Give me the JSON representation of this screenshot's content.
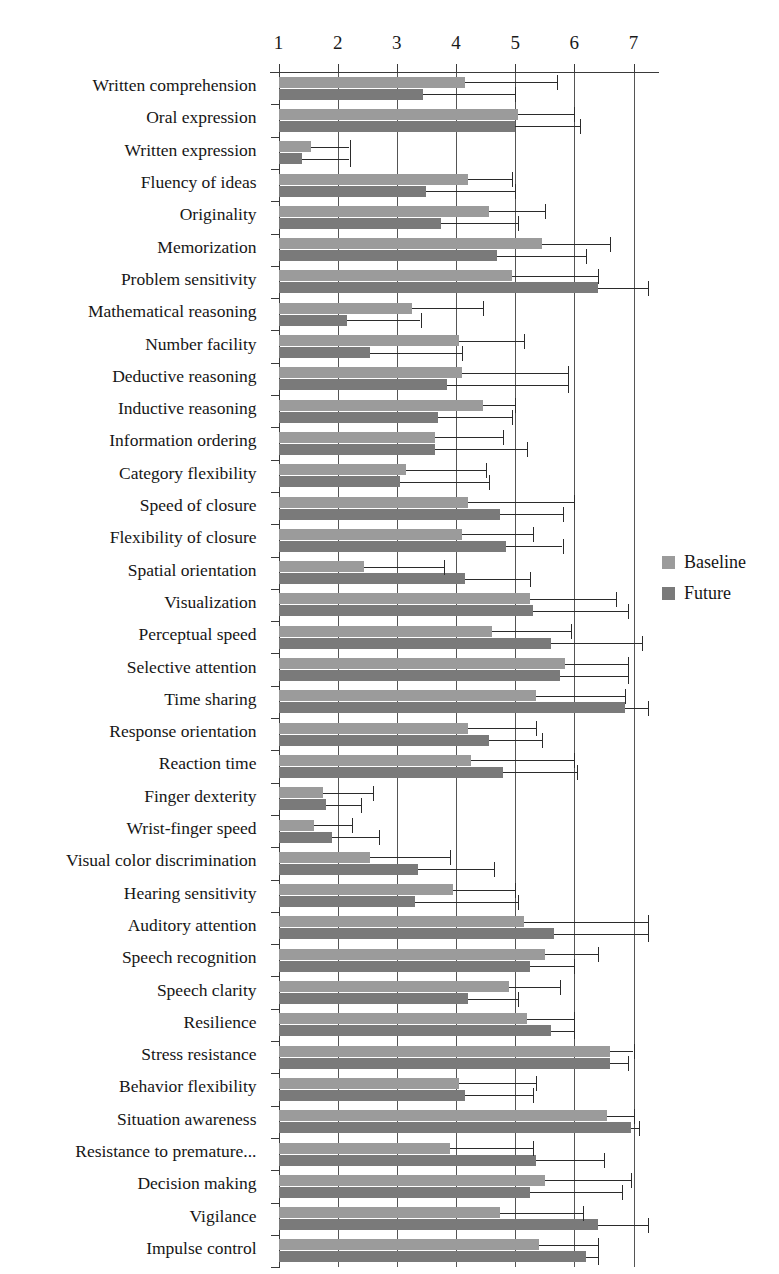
{
  "chart_data": {
    "type": "bar",
    "orientation": "horizontal",
    "title": "",
    "xlabel": "",
    "ylabel": "",
    "xlim": [
      1,
      7
    ],
    "xticks": [
      1,
      2,
      3,
      4,
      5,
      6,
      7
    ],
    "xticklabels": [
      "1",
      "2",
      "3",
      "4",
      "5",
      "6",
      "7"
    ],
    "grid": true,
    "grid_axis": "x",
    "legend_position": "right",
    "colors": {
      "baseline": "#9b9b9b",
      "future": "#7a7a7a",
      "axis": "#3a3a3a",
      "error_bar": "#2b2b2b",
      "background": "#ffffff",
      "text": "#161616"
    },
    "categories": [
      "Written comprehension",
      "Oral expression",
      "Written expression",
      "Fluency of ideas",
      "Originality",
      "Memorization",
      "Problem sensitivity",
      "Mathematical reasoning",
      "Number facility",
      "Deductive reasoning",
      "Inductive reasoning",
      "Information ordering",
      "Category flexibility",
      "Speed of closure",
      "Flexibility of closure",
      "Spatial orientation",
      "Visualization",
      "Perceptual speed",
      "Selective attention",
      "Time sharing",
      "Response orientation",
      "Reaction time",
      "Finger dexterity",
      "Wrist-finger speed",
      "Visual color discrimination",
      "Hearing sensitivity",
      "Auditory attention",
      "Speech recognition",
      "Speech clarity",
      "Resilience",
      "Stress resistance",
      "Behavior flexibility",
      "Situation awareness",
      "Resistance to premature...",
      "Decision making",
      "Vigilance",
      "Impulse control"
    ],
    "series": [
      {
        "name": "Baseline",
        "color": "#9b9b9b",
        "values": [
          4.15,
          5.05,
          1.55,
          4.2,
          4.55,
          5.45,
          4.95,
          3.25,
          4.05,
          4.1,
          4.45,
          3.65,
          3.15,
          4.2,
          4.1,
          2.45,
          5.25,
          4.6,
          5.85,
          5.35,
          4.2,
          4.25,
          1.75,
          1.6,
          2.55,
          3.95,
          5.15,
          5.5,
          4.9,
          5.2,
          6.6,
          4.05,
          6.55,
          3.9,
          5.5,
          4.75,
          5.4
        ],
        "errors": [
          1.55,
          0.95,
          0.65,
          0.75,
          0.95,
          1.15,
          1.45,
          1.2,
          1.1,
          1.8,
          0.55,
          1.15,
          1.35,
          1.8,
          1.2,
          1.35,
          1.45,
          1.35,
          1.05,
          1.5,
          1.15,
          1.75,
          0.85,
          0.65,
          1.35,
          1.05,
          2.15,
          0.9,
          0.85,
          0.8,
          0.4,
          1.3,
          0.45,
          1.4,
          1.45,
          1.4,
          1.0
        ]
      },
      {
        "name": "Future",
        "color": "#7a7a7a",
        "values": [
          3.45,
          5.0,
          1.4,
          3.5,
          3.75,
          4.7,
          6.4,
          2.15,
          2.55,
          3.85,
          3.7,
          3.65,
          3.05,
          4.75,
          4.85,
          4.15,
          5.3,
          5.6,
          5.75,
          6.85,
          4.55,
          4.8,
          1.8,
          1.9,
          3.35,
          3.3,
          5.65,
          5.25,
          4.2,
          5.6,
          6.6,
          4.15,
          6.95,
          5.35,
          5.25,
          6.4,
          6.2
        ],
        "errors": [
          1.55,
          1.1,
          0.8,
          1.5,
          1.3,
          1.5,
          0.9,
          1.25,
          1.55,
          2.05,
          1.25,
          1.55,
          1.5,
          1.05,
          0.95,
          1.1,
          1.6,
          1.55,
          1.15,
          0.85,
          0.9,
          1.25,
          0.6,
          0.8,
          1.3,
          1.75,
          1.6,
          0.75,
          0.85,
          0.4,
          0.3,
          1.15,
          0.15,
          1.15,
          1.55,
          0.9,
          0.2
        ]
      }
    ],
    "legend": [
      {
        "label": "Baseline",
        "color": "#9b9b9b"
      },
      {
        "label": "Future",
        "color": "#7a7a7a"
      }
    ]
  }
}
